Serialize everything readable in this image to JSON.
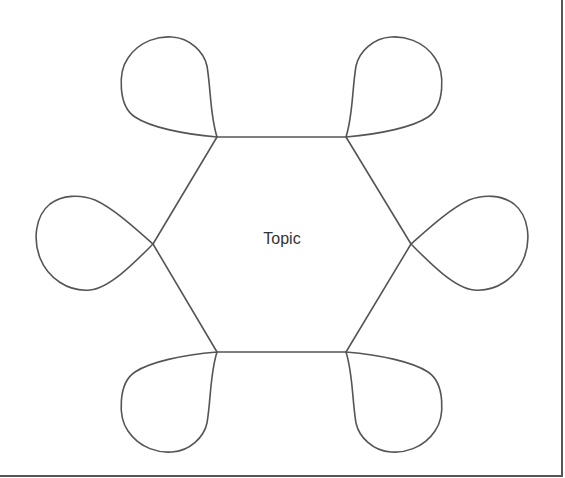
{
  "diagram": {
    "type": "hexagon-with-loops",
    "center_label": "Topic",
    "stroke_color": "#555555",
    "background": "#ffffff",
    "vertices": [
      {
        "name": "top-left",
        "x": 217,
        "y": 137
      },
      {
        "name": "top-right",
        "x": 346,
        "y": 137
      },
      {
        "name": "right",
        "x": 411,
        "y": 244
      },
      {
        "name": "bottom-right",
        "x": 346,
        "y": 352
      },
      {
        "name": "bottom-left",
        "x": 217,
        "y": 352
      },
      {
        "name": "left",
        "x": 153,
        "y": 244
      }
    ],
    "loop_count": 6
  }
}
